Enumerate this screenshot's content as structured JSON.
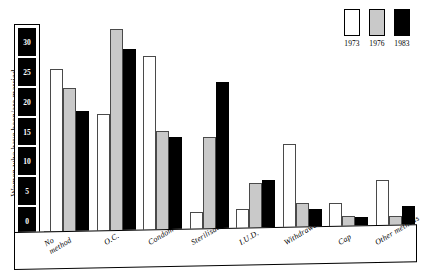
{
  "chart": {
    "type": "bar",
    "ylabel": "Women who have been/are married",
    "percent_symbol": "%",
    "y_ticks": [
      30,
      25,
      20,
      15,
      10,
      5,
      0
    ],
    "ylim": [
      0,
      32
    ],
    "grid": false,
    "legend_position": "top-right"
  },
  "legend": {
    "entries": [
      {
        "label": "1973",
        "color": "#ffffff",
        "name": "swatch-1973"
      },
      {
        "label": "1976",
        "color": "#c9c9c9",
        "name": "swatch-1976"
      },
      {
        "label": "1983",
        "color": "#000000",
        "name": "swatch-1983"
      }
    ]
  },
  "chart_data": {
    "type": "bar",
    "title": "",
    "xlabel": "",
    "ylabel": "Women who have been/are married",
    "ylim": [
      0,
      32
    ],
    "yticks": [
      0,
      5,
      10,
      15,
      20,
      25,
      30
    ],
    "grid": false,
    "legend_position": "top-right",
    "unit": "%",
    "categories": [
      "No method",
      "O.C.",
      "Condom",
      "Sterilisation",
      "I.U.D.",
      "Withdrawal",
      "Cap",
      "Other methods"
    ],
    "category_lines": [
      [
        "No",
        "method"
      ],
      [
        "O.C.",
        ""
      ],
      [
        "Condom",
        ""
      ],
      [
        "Sterilisation",
        ""
      ],
      [
        "I.U.D.",
        ""
      ],
      [
        "Withdrawal",
        ""
      ],
      [
        "Cap",
        ""
      ],
      [
        "Other methods",
        ""
      ]
    ],
    "series": [
      {
        "name": "1973",
        "color": "#ffffff",
        "values": [
          25,
          18,
          27,
          3,
          3.5,
          13.5,
          4.5,
          8
        ]
      },
      {
        "name": "1976",
        "color": "#c9c9c9",
        "values": [
          22,
          31,
          15.5,
          14.5,
          7.5,
          4.5,
          2.5,
          2.5
        ]
      },
      {
        "name": "1983",
        "color": "#000000",
        "values": [
          18.5,
          28,
          14.5,
          23,
          8,
          3.5,
          2.3,
          4
        ]
      }
    ]
  }
}
